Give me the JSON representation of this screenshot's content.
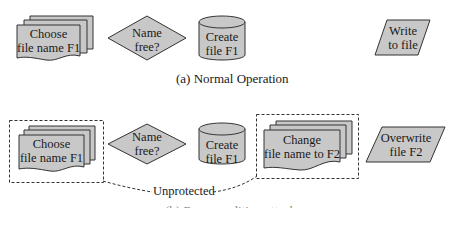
{
  "colors": {
    "shape_fill": "#c8c8c8",
    "shape_stroke": "#333333",
    "dash_stroke": "#333333",
    "background": "#ffffff"
  },
  "diagram_a": {
    "caption": "(a) Normal Operation",
    "nodes": [
      {
        "id": "choose",
        "shape": "multi-document",
        "lines": [
          "Choose",
          "file name F1"
        ]
      },
      {
        "id": "namefree",
        "shape": "decision-diamond",
        "lines": [
          "Name",
          "free?"
        ]
      },
      {
        "id": "create",
        "shape": "cylinder",
        "lines": [
          "Create",
          "file F1"
        ]
      },
      {
        "id": "write",
        "shape": "parallelogram",
        "lines": [
          "Write",
          "to file"
        ]
      }
    ]
  },
  "diagram_b": {
    "caption": "(b) Race condition attack",
    "unprotected_label": "Unprotected",
    "nodes": [
      {
        "id": "choose",
        "shape": "multi-document",
        "lines": [
          "Choose",
          "file name F1"
        ],
        "dashed_box": true
      },
      {
        "id": "namefree",
        "shape": "decision-diamond",
        "lines": [
          "Name",
          "free?"
        ]
      },
      {
        "id": "create",
        "shape": "cylinder",
        "lines": [
          "Create",
          "file F1"
        ]
      },
      {
        "id": "change",
        "shape": "multi-document",
        "lines": [
          "Change",
          "file name to F2"
        ],
        "dashed_box": true
      },
      {
        "id": "overwrite",
        "shape": "parallelogram",
        "lines": [
          "Overwrite",
          "file F2"
        ]
      }
    ]
  }
}
